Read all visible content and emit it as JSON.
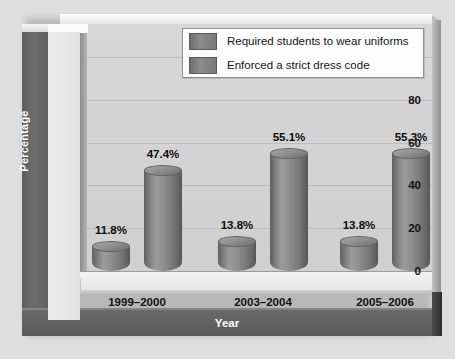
{
  "chart_data": {
    "type": "bar",
    "title": "",
    "xlabel": "Year",
    "ylabel": "Percentage",
    "categories": [
      "1999–2000",
      "2003–2004",
      "2005–2006"
    ],
    "series": [
      {
        "name": "Required students to wear uniforms",
        "values": [
          11.8,
          13.8,
          13.8
        ],
        "labels": [
          "11.8%",
          "13.8%",
          "13.8%"
        ],
        "color": "#7d7d7d"
      },
      {
        "name": "Enforced a strict dress code",
        "values": [
          47.4,
          55.1,
          55.3
        ],
        "labels": [
          "47.4%",
          "55.1%",
          "55.3%"
        ],
        "color": "#7d7d7d"
      }
    ],
    "ylim": [
      0,
      100
    ],
    "yticks": [
      100,
      80,
      60,
      40,
      20,
      0
    ],
    "ytick_labels": [
      "100",
      "80",
      "60",
      "40",
      "20",
      "0"
    ],
    "grid": true,
    "legend_position": "top-right",
    "style": "3d-cylinder"
  },
  "legend": {
    "items": [
      {
        "label": "Required students to wear uniforms"
      },
      {
        "label": "Enforced a strict dress code"
      }
    ]
  }
}
